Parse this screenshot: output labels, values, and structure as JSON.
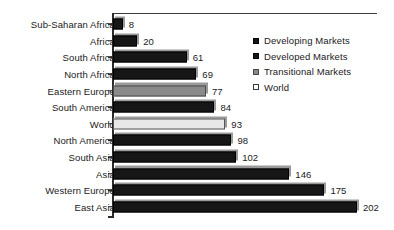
{
  "chart_data": {
    "type": "bar",
    "orientation": "horizontal",
    "title": "",
    "subtitle": "",
    "xlabel": "",
    "ylabel": "",
    "xlim": [
      0,
      202
    ],
    "grid": false,
    "legend_position": "right",
    "categories": [
      "Sub-Saharan Africa",
      "Africa",
      "South Africa",
      "North Africa",
      "Eastern Europe",
      "South America",
      "World",
      "North America",
      "South Asia",
      "Asia",
      "Western Europe",
      "East Asia"
    ],
    "values": [
      8,
      20,
      61,
      69,
      77,
      84,
      93,
      98,
      102,
      146,
      175,
      202
    ],
    "point_series": [
      "Developing Markets",
      "Developing Markets",
      "Developed Markets",
      "Developing Markets",
      "Transitional Markets",
      "Developing Markets",
      "World",
      "Developed Markets",
      "Developing Markets",
      "Developing Markets",
      "Developed Markets",
      "Developing Markets"
    ],
    "bars": [
      {
        "label": "Sub-Saharan Africa",
        "value": 8,
        "value_text": "8",
        "style": "dark"
      },
      {
        "label": "Africa",
        "value": 20,
        "value_text": "20",
        "style": "dark"
      },
      {
        "label": "South Africa",
        "value": 61,
        "value_text": "61",
        "style": "dark"
      },
      {
        "label": "North Africa",
        "value": 69,
        "value_text": "69",
        "style": "dark"
      },
      {
        "label": "Eastern Europe",
        "value": 77,
        "value_text": "77",
        "style": "gray"
      },
      {
        "label": "South America",
        "value": 84,
        "value_text": "84",
        "style": "dark"
      },
      {
        "label": "World",
        "value": 93,
        "value_text": "93",
        "style": "light"
      },
      {
        "label": "North America",
        "value": 98,
        "value_text": "98",
        "style": "dark"
      },
      {
        "label": "South Asia",
        "value": 102,
        "value_text": "102",
        "style": "dark"
      },
      {
        "label": "Asia",
        "value": 146,
        "value_text": "146",
        "style": "dark"
      },
      {
        "label": "Western Europe",
        "value": 175,
        "value_text": "175",
        "style": "dark"
      },
      {
        "label": "East Asia",
        "value": 202,
        "value_text": "202",
        "style": "dark"
      }
    ],
    "legend": [
      {
        "label": "Developing Markets",
        "style": "dark"
      },
      {
        "label": "Developed Markets",
        "style": "dark"
      },
      {
        "label": "Transitional Markets",
        "style": "gray"
      },
      {
        "label": "World",
        "style": "light"
      }
    ],
    "colors": {
      "developing_markets": "#161616",
      "developed_markets": "#161616",
      "transitional_markets": "#8a8a8a",
      "world": "#e8e8e8",
      "bar_shadow": "#9a9a9a",
      "axis": "#2b2b2b",
      "text": "#1a1a1a",
      "background": "#ffffff"
    },
    "scale_px_per_unit": 1.208
  }
}
